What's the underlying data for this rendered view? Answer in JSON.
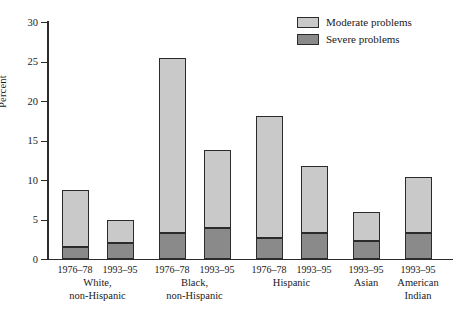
{
  "chart_data": {
    "type": "bar",
    "subtype": "stacked",
    "title": "",
    "xlabel": "",
    "ylabel": "Percent",
    "ylim": [
      0,
      30
    ],
    "yticks": [
      0,
      5,
      10,
      15,
      20,
      25,
      30
    ],
    "ytick_labels": [
      "0",
      "5",
      "10",
      "15",
      "20",
      "25",
      "30"
    ],
    "grid": false,
    "legend_position": "top-right",
    "legend": [
      "Moderate problems",
      "Severe problems"
    ],
    "categories": [
      "1976–78",
      "1993–95",
      "1976–78",
      "1993–95",
      "1976–78",
      "1993–95",
      "1993–95",
      "1993–95"
    ],
    "groups": [
      {
        "label": "White,\nnon-Hispanic",
        "line1": "White,",
        "line2": "non-Hispanic",
        "bars": [
          0,
          1
        ]
      },
      {
        "label": "Black,\nnon-Hispanic",
        "line1": "Black,",
        "line2": "non-Hispanic",
        "bars": [
          2,
          3
        ]
      },
      {
        "label": "Hispanic",
        "line1": "Hispanic",
        "line2": "",
        "bars": [
          4,
          5
        ]
      },
      {
        "label": "Asian",
        "line1": "Asian",
        "line2": "",
        "bars": [
          6
        ]
      },
      {
        "label": "American\nIndian",
        "line1": "American",
        "line2": "Indian",
        "bars": [
          7
        ]
      }
    ],
    "series": [
      {
        "name": "Severe problems",
        "color": "#8a8a8a",
        "values": [
          1.5,
          2.0,
          3.3,
          3.9,
          2.7,
          3.3,
          2.3,
          3.3
        ]
      },
      {
        "name": "Moderate problems",
        "color": "#c9c9c9",
        "values": [
          7.2,
          2.9,
          22.1,
          9.9,
          15.4,
          8.5,
          3.7,
          7.1
        ]
      }
    ],
    "totals": [
      8.7,
      4.9,
      25.4,
      13.8,
      18.1,
      11.8,
      6.0,
      10.4
    ],
    "colors": {
      "moderate": "#c9c9c9",
      "severe": "#8a8a8a",
      "axis": "#2b2b2b",
      "background": "#ffffff"
    }
  }
}
